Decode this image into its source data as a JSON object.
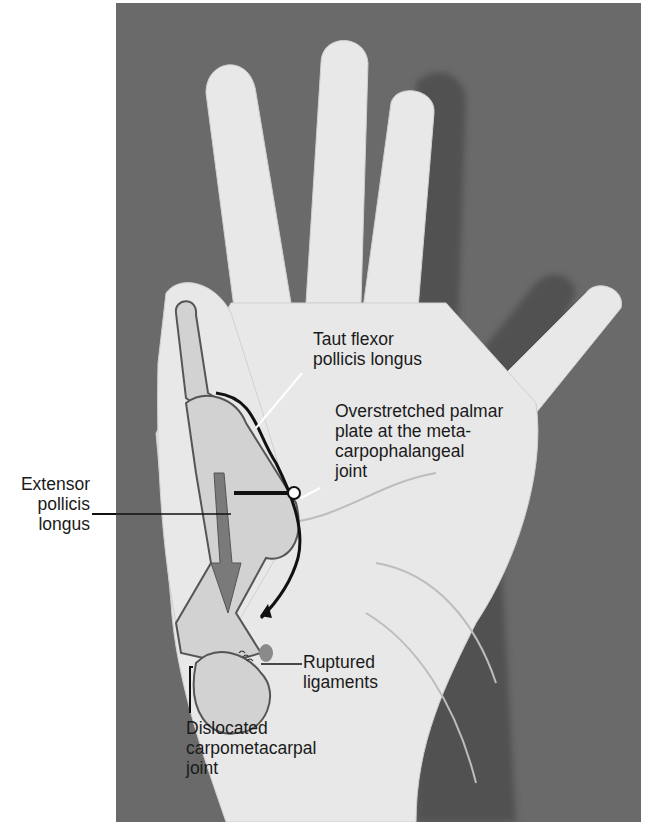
{
  "figure": {
    "labels": {
      "taut_flexor": [
        "Taut flexor",
        "pollicis longus"
      ],
      "overstretched": [
        "Overstretched palmar",
        "plate at the meta-",
        "carpophalangeal",
        "joint"
      ],
      "extensor": [
        "Extensor",
        "pollicis",
        "longus"
      ],
      "ruptured": [
        "Ruptured",
        "ligaments"
      ],
      "dislocated": [
        "Dislocated",
        "carpometacarpal",
        "joint"
      ]
    },
    "colors": {
      "background": "#6a6a6a",
      "skin": "#e6e6e6",
      "bone_fill": "#cfcfcf",
      "arrow": "#7a7a7a",
      "text": "#1a1a1a"
    }
  }
}
